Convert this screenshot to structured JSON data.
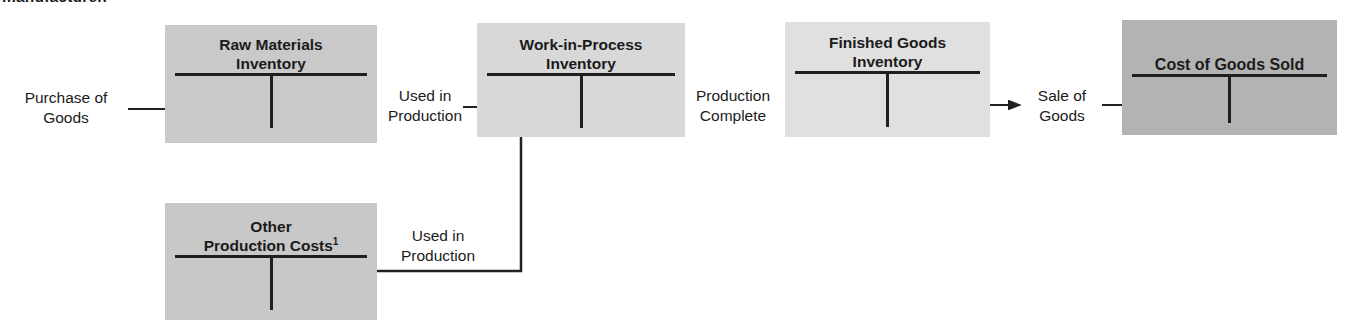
{
  "caption": {
    "clipped_text": "manufacturer."
  },
  "palette": {
    "line_color": "#222222",
    "raw_materials_bg": "#c9c9c9",
    "work_in_process_bg": "#d8d8d8",
    "finished_goods_bg": "#e0e0e0",
    "cost_of_goods_sold_bg": "#b3b3b3",
    "other_production_costs_bg": "#c8c8c8"
  },
  "accounts": [
    {
      "name": "raw-materials-inventory",
      "title_lines": [
        "Raw Materials",
        "Inventory"
      ]
    },
    {
      "name": "work-in-process-inventory",
      "title_lines": [
        "Work-in-Process",
        "Inventory"
      ]
    },
    {
      "name": "finished-goods-inventory",
      "title_lines": [
        "Finished Goods",
        "Inventory"
      ]
    },
    {
      "name": "cost-of-goods-sold",
      "title_lines": [
        "Cost of Goods Sold"
      ]
    },
    {
      "name": "other-production-costs",
      "title_lines": [
        "Other",
        "Production Costs"
      ],
      "footnote_superscript": "1"
    }
  ],
  "flow_labels": [
    {
      "name": "purchase-of-goods",
      "lines": [
        "Purchase of",
        "Goods"
      ]
    },
    {
      "name": "used-in-production",
      "lines": [
        "Used in",
        "Production"
      ]
    },
    {
      "name": "production-complete",
      "lines": [
        "Production",
        "Complete"
      ]
    },
    {
      "name": "sale-of-goods",
      "lines": [
        "Sale of",
        "Goods"
      ]
    },
    {
      "name": "used-in-production-other",
      "lines": [
        "Used in",
        "Production"
      ]
    }
  ]
}
